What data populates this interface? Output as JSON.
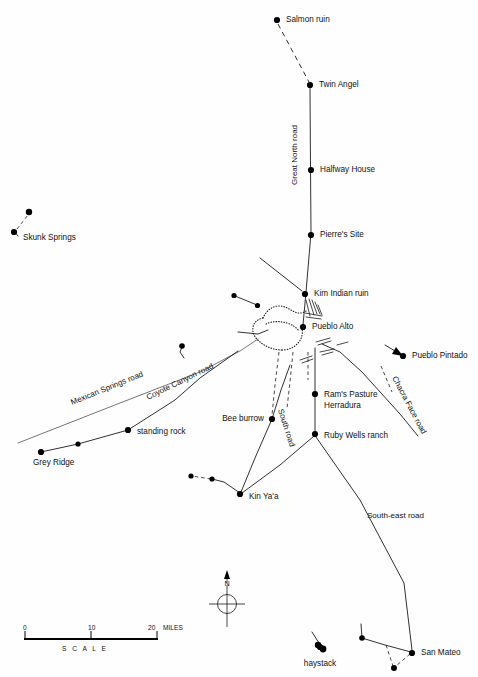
{
  "map": {
    "title": "Chaco Canyon prehistoric road network map",
    "background_color": "#fefefe",
    "ink_color": "#111111"
  },
  "sites": [
    {
      "id": "salmon-ruin",
      "label": "Salmon ruin",
      "x": 277,
      "y": 20,
      "lx": 286,
      "ly": 20,
      "anchor": "start"
    },
    {
      "id": "twin-angel",
      "label": "Twin Angel",
      "x": 310,
      "y": 85,
      "lx": 319,
      "ly": 85,
      "anchor": "start"
    },
    {
      "id": "halfway-house",
      "label": "Halfway House",
      "x": 311,
      "y": 170,
      "lx": 320,
      "ly": 170,
      "anchor": "start"
    },
    {
      "id": "pierres-site",
      "label": "Pierre's Site",
      "x": 311,
      "y": 235,
      "lx": 320,
      "ly": 235,
      "anchor": "start"
    },
    {
      "id": "kim-indian-ruin",
      "label": "Kim Indian ruin",
      "x": 305,
      "y": 294,
      "lx": 314,
      "ly": 294,
      "anchor": "start"
    },
    {
      "id": "pueblo-alto",
      "label": "Pueblo Alto",
      "x": 303,
      "y": 327,
      "lx": 312,
      "ly": 327,
      "anchor": "start"
    },
    {
      "id": "skunk-springs",
      "label": "Skunk Springs",
      "x": 14,
      "y": 232,
      "lx": 23,
      "ly": 238,
      "anchor": "start"
    },
    {
      "id": "grey-ridge",
      "label": "Grey Ridge",
      "x": 41,
      "y": 452,
      "lx": 33,
      "ly": 463,
      "anchor": "start"
    },
    {
      "id": "standing-rock",
      "label": "standing rock",
      "x": 128,
      "y": 430,
      "lx": 137,
      "ly": 432,
      "anchor": "start"
    },
    {
      "id": "bee-burrow",
      "label": "Bee burrow",
      "x": 272,
      "y": 419,
      "lx": 264,
      "ly": 419,
      "anchor": "end"
    },
    {
      "id": "kin-yaa",
      "label": "Kin Ya'a",
      "x": 240,
      "y": 494,
      "lx": 249,
      "ly": 497,
      "anchor": "start"
    },
    {
      "id": "rams-pasture",
      "label": "Ram's Pasture",
      "x": 315,
      "y": 394,
      "lx": 324,
      "ly": 395,
      "anchor": "start"
    },
    {
      "id": "herradura",
      "label": "Herradura",
      "x": null,
      "y": null,
      "lx": 324,
      "ly": 406,
      "anchor": "start"
    },
    {
      "id": "ruby-wells-ranch",
      "label": "Ruby Wells ranch",
      "x": 315,
      "y": 434,
      "lx": 324,
      "ly": 436,
      "anchor": "start"
    },
    {
      "id": "pueblo-pintado",
      "label": "Pueblo Pintado",
      "x": 403,
      "y": 356,
      "lx": 412,
      "ly": 356,
      "anchor": "start"
    },
    {
      "id": "san-mateo",
      "label": "San Mateo",
      "x": 412,
      "y": 653,
      "lx": 421,
      "ly": 653,
      "anchor": "start"
    },
    {
      "id": "haystack",
      "label": "haystack",
      "x": 320,
      "y": 647,
      "lx": 320,
      "ly": 664,
      "anchor": "middle"
    }
  ],
  "roads": [
    {
      "id": "great-north-road",
      "label": "Great North road",
      "lx": 297,
      "ly": 185,
      "rotate": -90
    },
    {
      "id": "mexican-springs-road",
      "label": "Mexican Springs road",
      "lx": 72,
      "ly": 405,
      "rotate": -22
    },
    {
      "id": "coyote-canyon-road",
      "label": "Coyote Canyon road",
      "lx": 148,
      "ly": 400,
      "rotate": -26
    },
    {
      "id": "south-road",
      "label": "South road",
      "lx": 278,
      "ly": 410,
      "rotate": 72
    },
    {
      "id": "chacra-face-road",
      "label": "Chacra Face road",
      "lx": 392,
      "ly": 378,
      "rotate": 62
    },
    {
      "id": "south-east-road",
      "label": "South-east road",
      "lx": 367,
      "ly": 518,
      "rotate": 0
    }
  ],
  "scale": {
    "ticks": [
      "0",
      "10",
      "20"
    ],
    "units": "MILES",
    "caption": "S C A L E",
    "x0": 24,
    "x1": 158,
    "y": 637
  },
  "compass": {
    "north_label": "N",
    "cx": 227,
    "cy": 601
  }
}
